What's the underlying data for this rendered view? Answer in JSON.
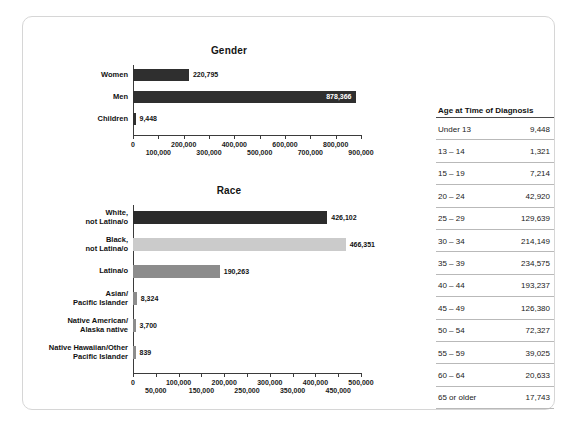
{
  "chart_data": [
    {
      "type": "bar",
      "orientation": "horizontal",
      "title": "Gender",
      "xlabel": "",
      "ylabel": "",
      "xlim": [
        0,
        900000
      ],
      "grid": false,
      "legend": "none",
      "categories": [
        "Women",
        "Men",
        "Children"
      ],
      "values": [
        220795,
        878366,
        9448
      ],
      "value_labels": [
        "220,795",
        "878,366",
        "9,448"
      ],
      "bar_colors": [
        "#2f2f2f",
        "#2f2f2f",
        "#2f2f2f"
      ],
      "label_placement": [
        "outside",
        "inside",
        "outside"
      ],
      "tick_values": [
        0,
        100000,
        200000,
        300000,
        400000,
        500000,
        600000,
        700000,
        800000,
        900000
      ],
      "tick_labels": [
        "0",
        "100,000",
        "200,000",
        "300,000",
        "400,000",
        "500,000",
        "600,000",
        "700,000",
        "800,000",
        "900,000"
      ]
    },
    {
      "type": "bar",
      "orientation": "horizontal",
      "title": "Race",
      "xlabel": "",
      "ylabel": "",
      "xlim": [
        0,
        500000
      ],
      "grid": false,
      "legend": "none",
      "categories": [
        "White,\nnot Latina/o",
        "Black,\nnot Latina/o",
        "Latina/o",
        "Asian/\nPacific Islander",
        "Native American/\nAlaska native",
        "Native Hawaiian/Other\nPacific Islander"
      ],
      "values": [
        426102,
        466351,
        190263,
        8324,
        3700,
        839
      ],
      "value_labels": [
        "426,102",
        "466,351",
        "190,263",
        "8,324",
        "3,700",
        "839"
      ],
      "bar_colors": [
        "#2b2b2b",
        "#cbcbcb",
        "#8c8c8c",
        "#8c8c8c",
        "#8c8c8c",
        "#8c8c8c"
      ],
      "label_placement": [
        "outside",
        "outside",
        "outside",
        "outside",
        "outside",
        "outside"
      ],
      "tick_values": [
        0,
        50000,
        100000,
        150000,
        200000,
        250000,
        300000,
        350000,
        400000,
        450000,
        500000
      ],
      "tick_labels": [
        "0",
        "50,000",
        "100,000",
        "150,000",
        "200,000",
        "250,000",
        "300,000",
        "350,000",
        "400,000",
        "450,000",
        "500,000"
      ]
    }
  ],
  "age_table": {
    "header": "Age at Time of Diagnosis",
    "rows": [
      {
        "label": "Under 13",
        "value": "9,448"
      },
      {
        "label": "13 – 14",
        "value": "1,321"
      },
      {
        "label": "15 – 19",
        "value": "7,214"
      },
      {
        "label": "20 – 24",
        "value": "42,920"
      },
      {
        "label": "25 – 29",
        "value": "129,639"
      },
      {
        "label": "30 – 34",
        "value": "214,149"
      },
      {
        "label": "35 – 39",
        "value": "234,575"
      },
      {
        "label": "40 – 44",
        "value": "193,237"
      },
      {
        "label": "45 – 49",
        "value": "126,380"
      },
      {
        "label": "50 – 54",
        "value": "72,327"
      },
      {
        "label": "55 – 59",
        "value": "39,025"
      },
      {
        "label": "60 – 64",
        "value": "20,633"
      },
      {
        "label": "65 or older",
        "value": "17,743"
      }
    ]
  },
  "colors": {
    "bar_dark": "#2f2f2f",
    "bar_light": "#cbcbcb",
    "bar_medium": "#8c8c8c",
    "axis": "#3b3b3b",
    "frame": "#d6d6d6",
    "background": "#ffffff"
  }
}
